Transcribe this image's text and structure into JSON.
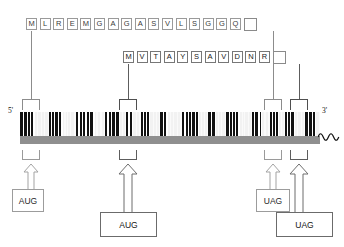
{
  "diagram": {
    "strand": {
      "five_prime_label": "5'",
      "three_prime_label": "3'",
      "tail_icon": "poly-a-tail-squiggle-icon",
      "backbone_color": "#8f8f8f",
      "bar_dark_color": "#111111",
      "bar_light_color": "#f2f2f2"
    },
    "peptides": [
      {
        "id": "orf1",
        "residues": [
          "M",
          "L",
          "R",
          "E",
          "M",
          "G",
          "A",
          "G",
          "A",
          "S",
          "V",
          "L",
          "S",
          "G",
          "G",
          "Q"
        ],
        "stop_box_label": "",
        "stop_box_name": "stop-codon-box"
      },
      {
        "id": "orf2",
        "residues": [
          "M",
          "V",
          "T",
          "A",
          "Y",
          "S",
          "A",
          "V",
          "D",
          "N",
          "R"
        ],
        "stop_box_label": "",
        "stop_box_name": "stop-codon-box"
      }
    ],
    "codon_callouts": [
      {
        "id": "start-1",
        "label": "AUG",
        "type": "start",
        "emphasis": "light"
      },
      {
        "id": "start-2",
        "label": "AUG",
        "type": "start",
        "emphasis": "dark"
      },
      {
        "id": "stop-1",
        "label": "UAG",
        "type": "stop",
        "emphasis": "light"
      },
      {
        "id": "stop-2",
        "label": "UAG",
        "type": "stop",
        "emphasis": "dark"
      }
    ],
    "colors": {
      "outline_light": "#9a9a9a",
      "outline_dark": "#5d5d5d",
      "text": "#1a1a1a"
    }
  }
}
